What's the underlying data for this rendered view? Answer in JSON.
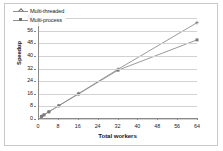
{
  "chart_data": {
    "type": "line",
    "title": "",
    "xlabel": "Total workers",
    "ylabel": "Speedup",
    "xlim": [
      0,
      64
    ],
    "ylim": [
      0,
      64
    ],
    "xticks": [
      0,
      8,
      16,
      24,
      32,
      40,
      48,
      56,
      64
    ],
    "yticks": [
      0,
      8,
      16,
      24,
      32,
      40,
      48,
      56,
      64
    ],
    "grid": "horizontal",
    "legend_position": "top-left",
    "x": [
      1,
      2,
      4,
      8,
      16,
      32,
      64
    ],
    "series": [
      {
        "name": "Multi-threaded",
        "marker": "cross",
        "color": "#8e8e8e",
        "values": [
          1,
          2,
          4,
          7.9,
          15.6,
          31.2,
          61.0
        ]
      },
      {
        "name": "Multi-process",
        "marker": "square",
        "color": "#8e8e8e",
        "values": [
          1,
          2,
          4,
          7.8,
          15.4,
          30.6,
          50.0
        ]
      }
    ]
  },
  "axes": {
    "y_title": "Speedup",
    "x_title": "Total workers",
    "y_tick_labels": [
      "0",
      "8",
      "16",
      "24",
      "32",
      "40",
      "48",
      "56",
      "64"
    ],
    "x_tick_labels": [
      "0",
      "8",
      "16",
      "24",
      "32",
      "40",
      "48",
      "56",
      "64"
    ]
  },
  "legend": {
    "items": [
      {
        "label": "Multi-threaded"
      },
      {
        "label": "Multi-process"
      }
    ]
  },
  "colors": {
    "line": "#8e8e8e",
    "grid": "#d2d2d2",
    "axis": "#8a8a8a",
    "frame": "#c9c9c9",
    "text": "#1a1a1a",
    "background": "#ffffff"
  }
}
